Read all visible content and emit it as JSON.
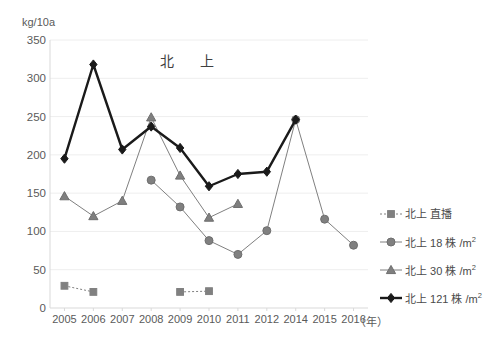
{
  "chart_data": {
    "type": "line",
    "title": "北　上",
    "unit_label": "kg/10a",
    "xlabel": "（年）",
    "ylabel": "kg/10a",
    "categories": [
      "2005",
      "2006",
      "2007",
      "2008",
      "2009",
      "2010",
      "2011",
      "2012",
      "2014",
      "2015",
      "2016"
    ],
    "ylim": [
      0,
      350
    ],
    "yticks": [
      0,
      50,
      100,
      150,
      200,
      250,
      300,
      350
    ],
    "ytick_labels": [
      "0",
      "50",
      "100",
      "150",
      "200",
      "250",
      "300",
      "350"
    ],
    "grid": true,
    "legend_position": "right",
    "series": [
      {
        "name": "北上 直播",
        "marker": "square",
        "line_style": "dashed",
        "color": "#808080",
        "values": [
          29,
          21,
          null,
          null,
          21,
          22,
          null,
          null,
          null,
          null,
          null
        ]
      },
      {
        "name": "北上 18 株 /m2",
        "name_base": "北上 18 株 /m",
        "name_sup": "2",
        "marker": "circle",
        "line_style": "solid",
        "color": "#808080",
        "values": [
          null,
          null,
          null,
          167,
          132,
          88,
          70,
          101,
          246,
          116,
          82
        ]
      },
      {
        "name": "北上 30 株 /m2",
        "name_base": "北上 30 株 /m",
        "name_sup": "2",
        "marker": "triangle",
        "line_style": "solid",
        "color": "#7f7f7f",
        "values": [
          146,
          120,
          140,
          249,
          173,
          118,
          136,
          null,
          null,
          null,
          null
        ]
      },
      {
        "name": "北上 121 株 /m2",
        "name_base": "北上 121 株 /m",
        "name_sup": "2",
        "marker": "diamond",
        "line_style": "solid-bold",
        "color": "#1a1a1a",
        "values": [
          195,
          318,
          207,
          237,
          209,
          159,
          175,
          178,
          246,
          null,
          null
        ]
      }
    ]
  },
  "legend": {
    "items": [
      {
        "label_base": "北上 直播",
        "label_sup": ""
      },
      {
        "label_base": "北上 18 株 /m",
        "label_sup": "2"
      },
      {
        "label_base": "北上 30 株 /m",
        "label_sup": "2"
      },
      {
        "label_base": "北上 121 株 /m",
        "label_sup": "2"
      }
    ]
  },
  "colors": {
    "background": "#ffffff",
    "gridline": "#eeeeee",
    "axis": "#d9d9d9",
    "text": "#595959",
    "series_gray": "#808080",
    "series_black": "#1a1a1a"
  }
}
